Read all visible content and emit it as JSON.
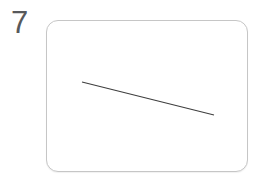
{
  "item": {
    "number": "7"
  },
  "card": {
    "background": "#ffffff",
    "border_color": "#c6c6c6",
    "corner_radius": 12
  },
  "figure": {
    "type": "line-segment",
    "stroke_color": "#3d3d3d",
    "stroke_width": 1.2,
    "x1": 35,
    "y1": 61,
    "x2": 167,
    "y2": 94
  },
  "colors": {
    "page_background": "#ffffff",
    "item_number_color": "#58595b"
  }
}
